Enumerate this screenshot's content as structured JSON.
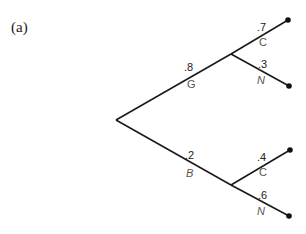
{
  "panel_label": "(a)",
  "tree": {
    "root": {
      "x": 116,
      "y": 120
    },
    "branches": [
      {
        "id": "G",
        "probability": ".8",
        "outcome": "G",
        "outcome_italic": false,
        "node": {
          "x": 231,
          "y": 54
        },
        "children": [
          {
            "id": "G-C",
            "probability": ".7",
            "outcome": "C",
            "outcome_italic": false,
            "leaf": {
              "x": 288,
              "y": 20
            }
          },
          {
            "id": "G-N",
            "probability": ".3",
            "outcome": "N",
            "outcome_italic": true,
            "leaf": {
              "x": 289,
              "y": 86
            }
          }
        ]
      },
      {
        "id": "B",
        "probability": ".2",
        "outcome": "B",
        "outcome_italic": true,
        "node": {
          "x": 231,
          "y": 185
        },
        "children": [
          {
            "id": "B-C",
            "probability": ".4",
            "outcome": "C",
            "outcome_italic": false,
            "leaf": {
              "x": 290,
              "y": 150
            }
          },
          {
            "id": "B-N",
            "probability": ".6",
            "outcome": "N",
            "outcome_italic": true,
            "leaf": {
              "x": 289,
              "y": 216
            }
          }
        ]
      }
    ]
  },
  "labels": {
    "g_prob": ".8",
    "g_outcome": "G",
    "b_prob": ".2",
    "b_outcome": "B",
    "gc_prob": ".7",
    "gc_outcome": "C",
    "gn_prob": ".3",
    "gn_outcome": "N",
    "bc_prob": ".4",
    "bc_outcome": "C",
    "bn_prob": ".6",
    "bn_outcome": "N"
  }
}
